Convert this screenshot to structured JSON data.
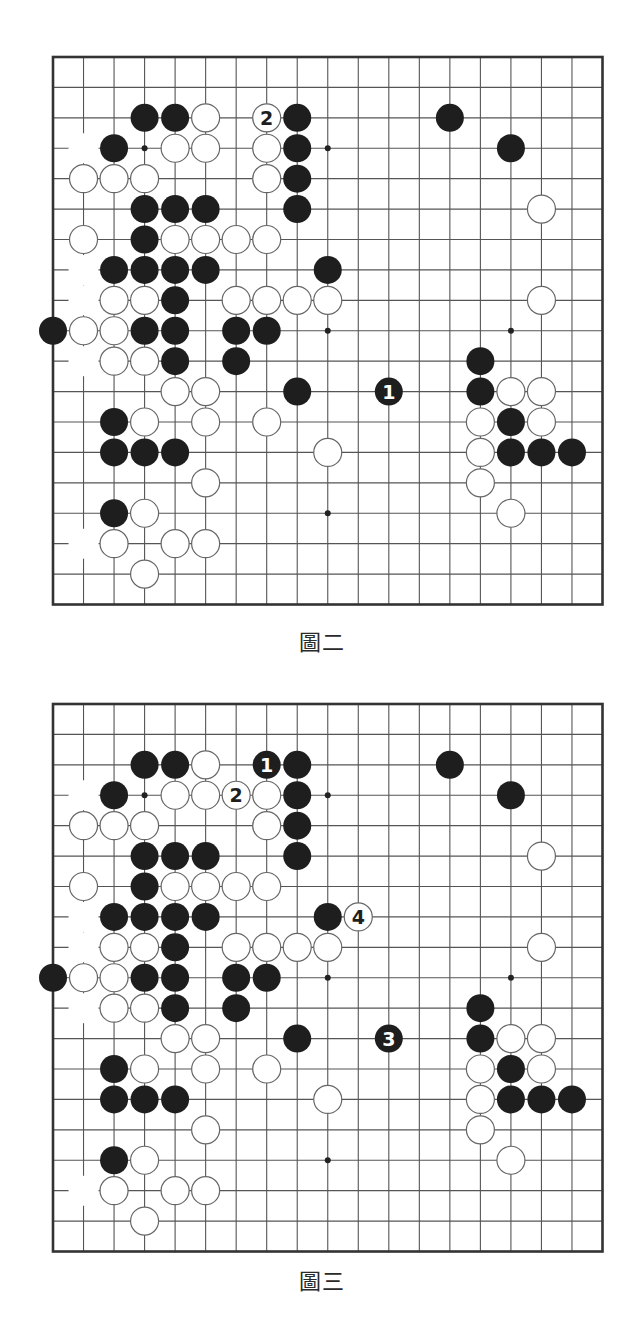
{
  "style": {
    "line_color": "#555555",
    "border_color": "#333333",
    "black_stone": "#1e1e1e",
    "white_stone": "#ffffff",
    "white_stone_outline": "#666666",
    "star_point": "#222222"
  },
  "board_size": 19,
  "star_points": [
    [
      3,
      3
    ],
    [
      9,
      3
    ],
    [
      15,
      3
    ],
    [
      3,
      9
    ],
    [
      9,
      9
    ],
    [
      15,
      9
    ],
    [
      3,
      15
    ],
    [
      9,
      15
    ],
    [
      15,
      15
    ]
  ],
  "base_position": {
    "black": [
      [
        3,
        2
      ],
      [
        4,
        2
      ],
      [
        8,
        2
      ],
      [
        13,
        2
      ],
      [
        2,
        3
      ],
      [
        8,
        3
      ],
      [
        15,
        3
      ],
      [
        8,
        4
      ],
      [
        3,
        5
      ],
      [
        4,
        5
      ],
      [
        5,
        5
      ],
      [
        8,
        5
      ],
      [
        3,
        6
      ],
      [
        2,
        7
      ],
      [
        3,
        7
      ],
      [
        4,
        7
      ],
      [
        5,
        7
      ],
      [
        9,
        7
      ],
      [
        4,
        8
      ],
      [
        0,
        9
      ],
      [
        3,
        9
      ],
      [
        4,
        9
      ],
      [
        6,
        9
      ],
      [
        7,
        9
      ],
      [
        4,
        10
      ],
      [
        6,
        10
      ],
      [
        14,
        10
      ],
      [
        8,
        11
      ],
      [
        14,
        11
      ],
      [
        2,
        12
      ],
      [
        15,
        12
      ],
      [
        2,
        13
      ],
      [
        3,
        13
      ],
      [
        4,
        13
      ],
      [
        15,
        13
      ],
      [
        16,
        13
      ],
      [
        17,
        13
      ],
      [
        2,
        15
      ]
    ],
    "white": [
      [
        5,
        2
      ],
      [
        4,
        3
      ],
      [
        5,
        3
      ],
      [
        7,
        3
      ],
      [
        1,
        4
      ],
      [
        2,
        4
      ],
      [
        3,
        4
      ],
      [
        7,
        4
      ],
      [
        16,
        5
      ],
      [
        1,
        6
      ],
      [
        4,
        6
      ],
      [
        5,
        6
      ],
      [
        6,
        6
      ],
      [
        7,
        6
      ],
      [
        2,
        8
      ],
      [
        3,
        8
      ],
      [
        6,
        8
      ],
      [
        7,
        8
      ],
      [
        8,
        8
      ],
      [
        9,
        8
      ],
      [
        16,
        8
      ],
      [
        1,
        9
      ],
      [
        2,
        9
      ],
      [
        2,
        10
      ],
      [
        3,
        10
      ],
      [
        4,
        11
      ],
      [
        5,
        11
      ],
      [
        15,
        11
      ],
      [
        16,
        11
      ],
      [
        3,
        12
      ],
      [
        5,
        12
      ],
      [
        7,
        12
      ],
      [
        14,
        12
      ],
      [
        16,
        12
      ],
      [
        9,
        13
      ],
      [
        14,
        13
      ],
      [
        5,
        14
      ],
      [
        14,
        14
      ],
      [
        3,
        15
      ],
      [
        15,
        15
      ],
      [
        2,
        16
      ],
      [
        4,
        16
      ],
      [
        5,
        16
      ],
      [
        3,
        17
      ]
    ],
    "erased": [
      [
        1,
        3
      ],
      [
        1,
        7
      ],
      [
        1,
        8
      ],
      [
        1,
        10
      ],
      [
        1,
        16
      ]
    ]
  },
  "diagrams": [
    {
      "caption": "圖二",
      "moves": [
        {
          "col": 11,
          "row": 11,
          "color": "black",
          "label": "1"
        },
        {
          "col": 7,
          "row": 2,
          "color": "white",
          "label": "2"
        }
      ]
    },
    {
      "caption": "圖三",
      "moves": [
        {
          "col": 7,
          "row": 2,
          "color": "black",
          "label": "1"
        },
        {
          "col": 6,
          "row": 3,
          "color": "white",
          "label": "2"
        },
        {
          "col": 11,
          "row": 11,
          "color": "black",
          "label": "3"
        },
        {
          "col": 10,
          "row": 7,
          "color": "white",
          "label": "4"
        }
      ]
    }
  ]
}
